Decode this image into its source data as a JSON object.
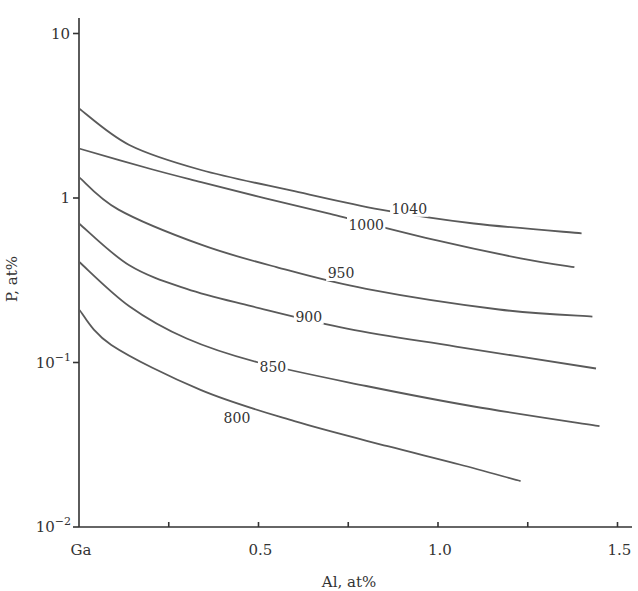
{
  "chart_data": {
    "type": "line",
    "title": "",
    "xlabel": "Al, at%",
    "ylabel": "P, at%",
    "x_scale": "linear",
    "y_scale": "log",
    "xlim": [
      0,
      1.55
    ],
    "ylim": [
      0.01,
      13
    ],
    "grid": false,
    "legend": "inline curve labels (temperature isotherms)",
    "x_ticks": [
      {
        "value": 0,
        "label": "Ga"
      },
      {
        "value": 0.25,
        "label": ""
      },
      {
        "value": 0.5,
        "label": "0.5"
      },
      {
        "value": 0.75,
        "label": ""
      },
      {
        "value": 1.0,
        "label": "1.0"
      },
      {
        "value": 1.25,
        "label": ""
      },
      {
        "value": 1.5,
        "label": "1.5"
      }
    ],
    "y_ticks": [
      {
        "value": 10,
        "label": "10",
        "exp": ""
      },
      {
        "value": 1,
        "label": "1",
        "exp": ""
      },
      {
        "value": 0.1,
        "label": "10",
        "exp": "−1"
      },
      {
        "value": 0.01,
        "label": "10",
        "exp": "−2"
      }
    ],
    "series": [
      {
        "name": "1040",
        "label_at": [
          0.92,
          0.86
        ],
        "x": [
          0,
          0.14,
          0.34,
          0.6,
          0.84,
          1.1,
          1.4
        ],
        "y": [
          3.5,
          2.1,
          1.48,
          1.1,
          0.85,
          0.7,
          0.61
        ]
      },
      {
        "name": "1000",
        "label_at": [
          0.8,
          0.69
        ],
        "x": [
          0,
          0.2,
          0.34,
          0.5,
          0.7,
          1.0,
          1.23,
          1.38
        ],
        "y": [
          2.0,
          1.5,
          1.25,
          1.02,
          0.8,
          0.55,
          0.43,
          0.38
        ]
      },
      {
        "name": "950",
        "label_at": [
          0.73,
          0.35
        ],
        "x": [
          0,
          0.11,
          0.34,
          0.55,
          0.8,
          1.17,
          1.43
        ],
        "y": [
          1.34,
          0.85,
          0.52,
          0.38,
          0.28,
          0.21,
          0.19
        ]
      },
      {
        "name": "900",
        "label_at": [
          0.64,
          0.19
        ],
        "x": [
          0,
          0.14,
          0.3,
          0.48,
          0.75,
          1.05,
          1.44
        ],
        "y": [
          0.7,
          0.39,
          0.28,
          0.22,
          0.16,
          0.125,
          0.092
        ]
      },
      {
        "name": "850",
        "label_at": [
          0.54,
          0.094
        ],
        "x": [
          0,
          0.14,
          0.3,
          0.5,
          0.8,
          1.1,
          1.45
        ],
        "y": [
          0.41,
          0.22,
          0.14,
          0.1,
          0.072,
          0.054,
          0.041
        ]
      },
      {
        "name": "800",
        "label_at": [
          0.44,
          0.046
        ],
        "x": [
          0,
          0.09,
          0.34,
          0.6,
          0.86,
          1.06,
          1.23
        ],
        "y": [
          0.21,
          0.128,
          0.068,
          0.044,
          0.031,
          0.024,
          0.019
        ]
      }
    ]
  },
  "colors": {
    "curve": "#5a5a5a",
    "axis": "#333333",
    "text": "#333333",
    "background": "#ffffff"
  },
  "plot_px": {
    "x0": 79,
    "x_per_unit": 359,
    "y_decade1": 198,
    "px_per_decade": 164.5,
    "y_axis_top": 18,
    "y_axis_bottom": 527,
    "x_axis_right": 632
  }
}
